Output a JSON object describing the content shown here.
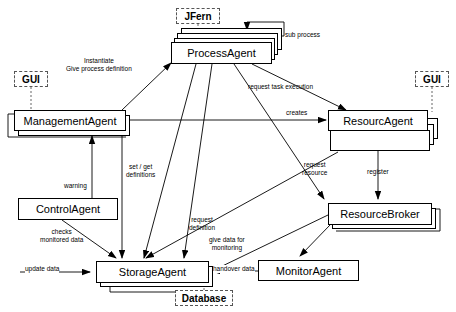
{
  "diagram": {
    "stroke_color": "#000000",
    "background_color": "#ffffff",
    "tag_border_color": "#555555"
  },
  "nodes": [
    {
      "id": "process_agent",
      "label": "ProcessAgent",
      "x": 171,
      "y": 42,
      "w": 101,
      "h": 22,
      "style": "stacked-up",
      "copies": 3
    },
    {
      "id": "management_agent",
      "label": "ManagementAgent",
      "x": 14,
      "y": 110,
      "w": 112,
      "h": 21,
      "style": "shadow",
      "copies": 1
    },
    {
      "id": "resource_agent",
      "label": "ResourcAgent",
      "x": 328,
      "y": 110,
      "w": 100,
      "h": 21,
      "style": "stacked-down",
      "copies": 4
    },
    {
      "id": "control_agent",
      "label": "ControlAgent",
      "x": 18,
      "y": 198,
      "w": 100,
      "h": 22,
      "style": "plain",
      "copies": 1
    },
    {
      "id": "resource_broker",
      "label": "ResourceBroker",
      "x": 328,
      "y": 203,
      "w": 104,
      "h": 22,
      "style": "shadow-right",
      "copies": 1
    },
    {
      "id": "storage_agent",
      "label": "StorageAgent",
      "x": 96,
      "y": 261,
      "w": 113,
      "h": 22,
      "style": "shadow",
      "copies": 1
    },
    {
      "id": "monitor_agent",
      "label": "MonitorAgent",
      "x": 258,
      "y": 260,
      "w": 101,
      "h": 21,
      "style": "plain",
      "copies": 1
    }
  ],
  "tags": [
    {
      "id": "tag_jfern",
      "label": "JFern",
      "x": 176,
      "y": 8,
      "w": 44,
      "h": 16,
      "attached_to": "process_agent"
    },
    {
      "id": "tag_gui_left",
      "label": "GUI",
      "x": 14,
      "y": 71,
      "w": 34,
      "h": 16,
      "attached_to": "management_agent"
    },
    {
      "id": "tag_gui_right",
      "label": "GUI",
      "x": 415,
      "y": 71,
      "w": 34,
      "h": 16,
      "attached_to": "resource_agent"
    },
    {
      "id": "tag_database",
      "label": "Database",
      "x": 175,
      "y": 290,
      "w": 58,
      "h": 16,
      "attached_to": "storage_agent"
    }
  ],
  "edge_labels": [
    {
      "id": "lbl_instantiate",
      "text": "Instantiate\nGive process definition",
      "x": 66,
      "y": 57,
      "boxed": false
    },
    {
      "id": "lbl_sub_process",
      "text": "sub process",
      "x": 285,
      "y": 31,
      "boxed": false
    },
    {
      "id": "lbl_request_task",
      "text": "request task execution",
      "x": 296,
      "y": 83,
      "boxed": false
    },
    {
      "id": "lbl_creates",
      "text": "creates",
      "x": 286,
      "y": 109,
      "boxed": false
    },
    {
      "id": "lbl_register",
      "text": "register",
      "x": 367,
      "y": 168,
      "boxed": false
    },
    {
      "id": "lbl_request_resource",
      "text": "request\nresource",
      "x": 302,
      "y": 161,
      "boxed": false
    },
    {
      "id": "lbl_set_get",
      "text": "set / get\ndefinitions",
      "x": 126,
      "y": 163,
      "boxed": false
    },
    {
      "id": "lbl_warning",
      "text": "warning",
      "x": 64,
      "y": 182,
      "boxed": false
    },
    {
      "id": "lbl_request_def",
      "text": "request\ndefinition",
      "x": 189,
      "y": 216,
      "boxed": false
    },
    {
      "id": "lbl_checks",
      "text": "checks\nmonitored data",
      "x": 40,
      "y": 228,
      "boxed": false
    },
    {
      "id": "lbl_give_data",
      "text": "give data for\nmonitoring",
      "x": 224,
      "y": 236,
      "boxed": false
    },
    {
      "id": "lbl_update_data",
      "text": "update data",
      "x": 31,
      "y": 263,
      "boxed": true
    },
    {
      "id": "lbl_handover_data",
      "text": "handover data",
      "x": 213,
      "y": 263,
      "boxed": true
    }
  ]
}
